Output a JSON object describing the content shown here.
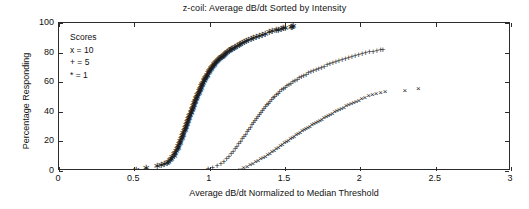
{
  "chart_data": {
    "type": "scatter",
    "title": "z-coil: Average dB/dt Sorted by Intensity",
    "xlabel": "Average dB/dt Normalized to Median Threshold",
    "ylabel": "Percentage Responding",
    "xlim": [
      0,
      3
    ],
    "ylim": [
      0,
      100
    ],
    "xticks": [
      0,
      0.5,
      1,
      1.5,
      2,
      2.5,
      3
    ],
    "xticklabels": [
      "0",
      "0.5",
      "1",
      "1.5",
      "2",
      "2.5",
      "3"
    ],
    "yticks": [
      0,
      20,
      40,
      60,
      80,
      100
    ],
    "yticklabels": [
      "0",
      "20",
      "40",
      "60",
      "80",
      "100"
    ],
    "grid": false,
    "legend_position": "upper-left-inside",
    "legend_title": "Scores",
    "legend_entries": [
      {
        "marker": "x",
        "label": "x = 10"
      },
      {
        "marker": "+",
        "label": "+ = 5"
      },
      {
        "marker": "*",
        "label": "* = 1"
      }
    ],
    "series": [
      {
        "name": "* = 1",
        "marker": "*",
        "color": "#1d1d1d",
        "x": [
          0.51,
          0.58,
          0.65,
          0.68,
          0.7,
          0.715,
          0.725,
          0.735,
          0.745,
          0.752,
          0.76,
          0.766,
          0.772,
          0.778,
          0.783,
          0.788,
          0.793,
          0.797,
          0.802,
          0.806,
          0.81,
          0.814,
          0.818,
          0.822,
          0.826,
          0.83,
          0.834,
          0.838,
          0.841,
          0.845,
          0.849,
          0.852,
          0.856,
          0.859,
          0.863,
          0.866,
          0.87,
          0.873,
          0.877,
          0.88,
          0.884,
          0.887,
          0.891,
          0.894,
          0.898,
          0.901,
          0.905,
          0.908,
          0.912,
          0.915,
          0.919,
          0.922,
          0.926,
          0.93,
          0.933,
          0.937,
          0.941,
          0.944,
          0.948,
          0.952,
          0.956,
          0.96,
          0.964,
          0.968,
          0.972,
          0.976,
          0.98,
          0.984,
          0.989,
          0.993,
          0.998,
          1.002,
          1.007,
          1.012,
          1.017,
          1.022,
          1.027,
          1.032,
          1.038,
          1.043,
          1.049,
          1.055,
          1.061,
          1.067,
          1.074,
          1.08,
          1.087,
          1.094,
          1.101,
          1.109,
          1.117,
          1.125,
          1.133,
          1.142,
          1.151,
          1.161,
          1.171,
          1.181,
          1.192,
          1.204,
          1.216,
          1.229,
          1.243,
          1.257,
          1.273,
          1.289,
          1.307,
          1.326,
          1.347,
          1.369,
          1.392,
          1.415,
          1.437,
          1.456,
          1.472,
          1.486,
          1.498,
          1.54,
          1.548,
          1.556
        ],
        "y": [
          1.0,
          2.0,
          3.2,
          4.0,
          4.6,
          5.4,
          6.2,
          7.2,
          8.2,
          9.2,
          10.3,
          11.4,
          12.5,
          13.6,
          14.7,
          15.8,
          16.9,
          18.0,
          19.1,
          20.2,
          21.3,
          22.4,
          23.5,
          24.6,
          25.6,
          26.7,
          27.8,
          28.8,
          29.9,
          30.9,
          32.0,
          33.0,
          34.0,
          35.0,
          36.0,
          37.0,
          38.0,
          39.0,
          40.0,
          41.0,
          42.0,
          42.9,
          43.9,
          44.8,
          45.8,
          46.7,
          47.6,
          48.5,
          49.4,
          50.3,
          51.2,
          52.1,
          53.0,
          53.9,
          54.7,
          55.6,
          56.4,
          57.3,
          58.1,
          58.9,
          59.7,
          60.5,
          61.3,
          62.1,
          62.9,
          63.7,
          64.4,
          65.2,
          65.9,
          66.7,
          67.4,
          68.1,
          68.8,
          69.5,
          70.2,
          70.9,
          71.6,
          72.3,
          72.9,
          73.6,
          74.2,
          74.9,
          75.5,
          76.1,
          76.7,
          77.3,
          77.9,
          78.5,
          79.1,
          79.7,
          80.3,
          80.9,
          81.5,
          82.1,
          82.7,
          83.3,
          83.9,
          84.5,
          85.1,
          85.8,
          86.4,
          87.1,
          87.8,
          88.5,
          89.2,
          89.9,
          90.6,
          91.3,
          92.1,
          92.8,
          93.6,
          94.3,
          95.0,
          95.6,
          96.1,
          96.5,
          96.8,
          97.3,
          97.6,
          97.8
        ]
      },
      {
        "name": "+ = 5",
        "marker": "+",
        "color": "#1d1d1d",
        "x": [
          0.99,
          1.02,
          1.05,
          1.075,
          1.095,
          1.112,
          1.128,
          1.142,
          1.156,
          1.169,
          1.181,
          1.193,
          1.205,
          1.216,
          1.227,
          1.238,
          1.249,
          1.259,
          1.27,
          1.28,
          1.29,
          1.3,
          1.31,
          1.32,
          1.33,
          1.34,
          1.35,
          1.36,
          1.37,
          1.38,
          1.39,
          1.4,
          1.411,
          1.421,
          1.432,
          1.443,
          1.454,
          1.465,
          1.477,
          1.489,
          1.501,
          1.513,
          1.526,
          1.539,
          1.552,
          1.566,
          1.58,
          1.594,
          1.609,
          1.624,
          1.64,
          1.656,
          1.672,
          1.689,
          1.706,
          1.724,
          1.742,
          1.76,
          1.779,
          1.798,
          1.818,
          1.838,
          1.858,
          1.879,
          1.9,
          1.922,
          1.944,
          1.966,
          1.989,
          2.012,
          2.036,
          2.06,
          2.085,
          2.11,
          2.135,
          2.15
        ],
        "y": [
          1.2,
          2.2,
          3.4,
          4.8,
          6.3,
          7.9,
          9.5,
          11.2,
          12.9,
          14.6,
          16.3,
          18.0,
          19.7,
          21.4,
          23.0,
          24.6,
          26.2,
          27.8,
          29.3,
          30.8,
          32.3,
          33.8,
          35.2,
          36.6,
          38.0,
          39.3,
          40.6,
          41.9,
          43.2,
          44.4,
          45.6,
          46.8,
          48.0,
          49.1,
          50.2,
          51.3,
          52.3,
          53.4,
          54.4,
          55.4,
          56.3,
          57.3,
          58.2,
          59.1,
          60.0,
          60.9,
          61.8,
          62.6,
          63.5,
          64.3,
          65.1,
          65.9,
          66.7,
          67.5,
          68.3,
          69.0,
          69.8,
          70.5,
          71.3,
          72.0,
          72.8,
          73.5,
          74.2,
          74.9,
          75.6,
          76.3,
          77.0,
          77.6,
          78.3,
          78.9,
          79.5,
          80.1,
          80.7,
          81.2,
          81.7,
          82.0
        ]
      },
      {
        "name": "x = 10",
        "marker": "x",
        "color": "#1d1d1d",
        "x": [
          1.2,
          1.225,
          1.248,
          1.268,
          1.287,
          1.305,
          1.322,
          1.338,
          1.354,
          1.369,
          1.384,
          1.399,
          1.413,
          1.427,
          1.441,
          1.455,
          1.469,
          1.482,
          1.496,
          1.509,
          1.522,
          1.535,
          1.548,
          1.561,
          1.574,
          1.587,
          1.6,
          1.613,
          1.626,
          1.639,
          1.652,
          1.665,
          1.678,
          1.691,
          1.704,
          1.718,
          1.731,
          1.745,
          1.758,
          1.772,
          1.786,
          1.8,
          1.815,
          1.829,
          1.844,
          1.859,
          1.874,
          1.89,
          1.906,
          1.922,
          1.938,
          1.955,
          1.972,
          1.99,
          2.008,
          2.03,
          2.055,
          2.08,
          2.105,
          2.135,
          2.165,
          2.295,
          2.385
        ],
        "y": [
          1.0,
          1.8,
          2.8,
          3.8,
          4.8,
          5.8,
          6.8,
          7.8,
          8.8,
          9.8,
          10.8,
          11.8,
          12.8,
          13.8,
          14.8,
          15.8,
          16.8,
          17.7,
          18.6,
          19.5,
          20.4,
          21.3,
          22.2,
          23.1,
          24.0,
          24.9,
          25.8,
          26.7,
          27.6,
          28.4,
          29.2,
          30.0,
          30.8,
          31.6,
          32.4,
          33.2,
          34.0,
          34.8,
          35.6,
          36.4,
          37.2,
          38.0,
          38.8,
          39.6,
          40.4,
          41.2,
          42.0,
          42.8,
          43.6,
          44.4,
          45.2,
          46.0,
          46.8,
          47.6,
          48.4,
          49.4,
          50.5,
          51.4,
          52.2,
          53.0,
          53.6,
          54.0,
          55.5
        ]
      }
    ]
  }
}
